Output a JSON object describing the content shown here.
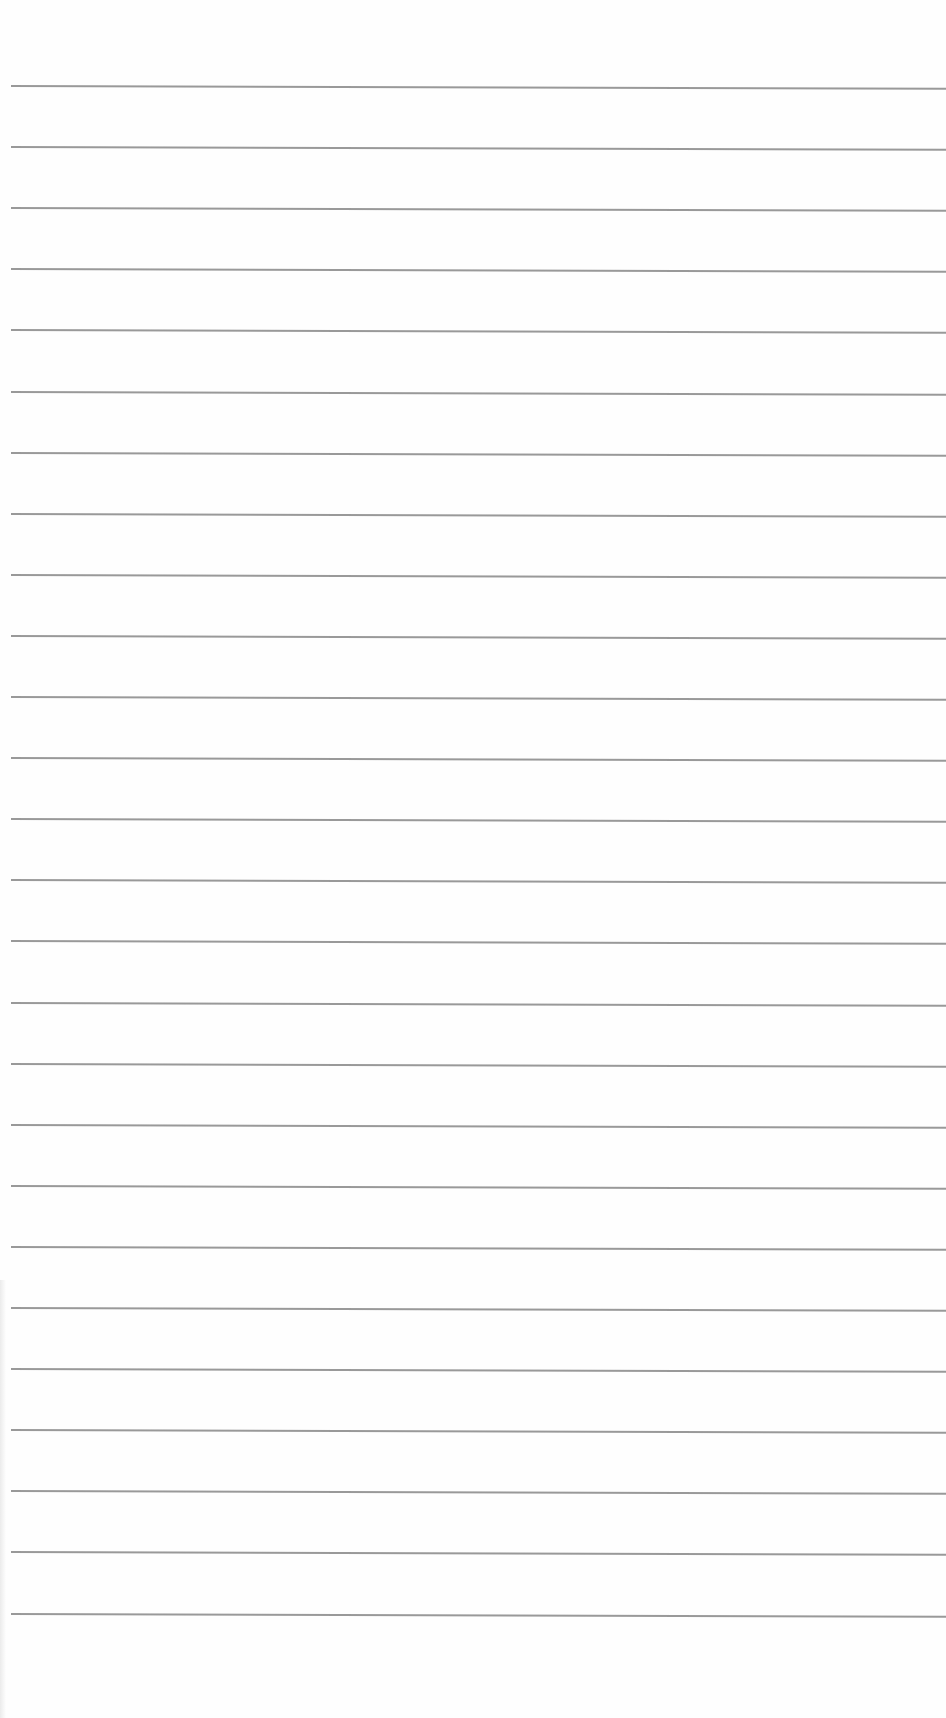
{
  "page": {
    "type": "lined-paper",
    "background_color": "#ffffff",
    "rule_color": "#8e8e8e",
    "rule_count": 26,
    "first_rule_y": 85,
    "rule_spacing": 61.1,
    "rule_left_x": 11,
    "text": ""
  }
}
